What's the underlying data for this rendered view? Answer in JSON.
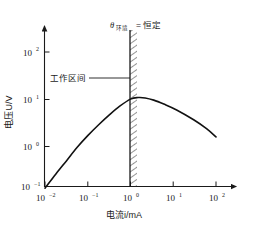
{
  "chart_data": {
    "type": "line",
    "title": "",
    "xlabel": "电流i/mA",
    "ylabel": "电压U/V",
    "xscale": "log",
    "yscale": "log",
    "xlim": [
      0.01,
      100
    ],
    "ylim": [
      0.1,
      1000
    ],
    "grid": false,
    "legend": null,
    "xticks": [
      {
        "value": 0.01,
        "mantissa": "10",
        "exponent": "−2"
      },
      {
        "value": 0.1,
        "mantissa": "10",
        "exponent": "−1"
      },
      {
        "value": 1,
        "mantissa": "10",
        "exponent": "0"
      },
      {
        "value": 10,
        "mantissa": "10",
        "exponent": "1"
      },
      {
        "value": 100,
        "mantissa": "10",
        "exponent": "2"
      }
    ],
    "yticks": [
      {
        "value": 0.1,
        "mantissa": "10",
        "exponent": "−1"
      },
      {
        "value": 1,
        "mantissa": "10",
        "exponent": "0"
      },
      {
        "value": 10,
        "mantissa": "10",
        "exponent": "1"
      },
      {
        "value": 100,
        "mantissa": "10",
        "exponent": "2"
      }
    ],
    "series": [
      {
        "name": "U-I characteristic",
        "x": [
          0.01,
          0.018,
          0.032,
          0.056,
          0.1,
          0.18,
          0.32,
          0.56,
          1.0,
          1.5,
          2.2,
          3.5,
          6.0,
          12.0,
          30.0,
          60.0,
          100.0
        ],
        "y": [
          0.13,
          0.26,
          0.5,
          0.95,
          1.7,
          2.9,
          4.7,
          7.2,
          10.2,
          11.0,
          10.8,
          9.7,
          8.0,
          6.0,
          3.7,
          2.4,
          1.6
        ]
      }
    ],
    "annotations": [
      {
        "name": "ambient-constant-label",
        "symbol": "θ",
        "subscript": "环境",
        "equals": "= 恒定",
        "full_text": "θ环境 = 恒定"
      },
      {
        "name": "working-range-label",
        "text": "工作区间",
        "points_to": "hatched-working-band"
      }
    ],
    "regions": [
      {
        "name": "hatched-working-band",
        "x_center": 1.0,
        "description": "vertical hatched band at i = 10^0 mA marking the operating region"
      }
    ],
    "colors": {
      "axis": "#1a1a1a",
      "curve": "#111111",
      "hatch": "#2b2b2b",
      "background": "#ffffff"
    }
  }
}
